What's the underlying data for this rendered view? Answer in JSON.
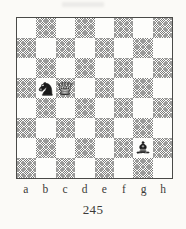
{
  "caption": "245",
  "board": {
    "files": [
      "a",
      "b",
      "c",
      "d",
      "e",
      "f",
      "g",
      "h"
    ],
    "ranks": [
      "8",
      "7",
      "6",
      "5",
      "4",
      "3",
      "2",
      "1"
    ],
    "orientation": "white-bottom",
    "light_square_color": "#fdfdfb",
    "dark_square_color": "#8f8f8f",
    "border_color": "#4a4a48",
    "page_background": "#fbfaf7",
    "pieces": [
      {
        "square": "b5",
        "piece": "knight",
        "color": "black",
        "icon": "black-knight-icon"
      },
      {
        "square": "c5",
        "piece": "queen",
        "color": "white",
        "icon": "white-queen-icon"
      },
      {
        "square": "g2",
        "piece": "bishop",
        "color": "black",
        "icon": "black-bishop-icon"
      }
    ]
  }
}
